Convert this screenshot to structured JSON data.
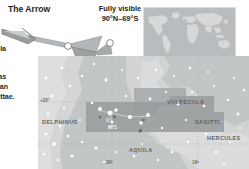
{
  "page": {
    "title": "The Arrow",
    "visibility": {
      "line1": "Fully visible",
      "line2": "90°N–69°S"
    },
    "body_text_fragments": [
      {
        "text": "uila"
      },
      {
        "text": "has"
      },
      {
        "text": "s an"
      },
      {
        "text": "gittae."
      }
    ]
  },
  "world_inset": {
    "background_color": "#b9bcbe",
    "land_color": "#d6d8d9",
    "border_color": "#d9dcdd"
  },
  "star_chart": {
    "background_color": "#c3c6c7",
    "milkyway_color": "#d2d4d5",
    "highlight_color": "#9a9d9f",
    "star_color": "#ffffff",
    "grid_color": "#a9acad",
    "constellations": [
      {
        "name": "VULPECULA",
        "x": 129,
        "y": 43
      },
      {
        "name": "DELPHINUS",
        "x": 4,
        "y": 63
      },
      {
        "name": "SAGITTA",
        "x": 157,
        "y": 63
      },
      {
        "name": "AQUILA",
        "x": 91,
        "y": 91
      },
      {
        "name": "HERCULES",
        "x": 169,
        "y": 79
      }
    ],
    "coordinates": [
      {
        "label": "+20°",
        "x": 2,
        "y": 42
      },
      {
        "label": "20ʰ",
        "x": 68,
        "y": 104
      },
      {
        "label": "19ʰ",
        "x": 154,
        "y": 104
      }
    ],
    "objects": [
      {
        "label": "M71",
        "x": 70,
        "y": 69
      }
    ],
    "stars_labeled": [
      {
        "label": "γ",
        "x": 61,
        "y": 58
      },
      {
        "label": "δ",
        "x": 75,
        "y": 58
      },
      {
        "label": "α",
        "x": 104,
        "y": 61
      },
      {
        "label": "β",
        "x": 101,
        "y": 72
      }
    ]
  }
}
